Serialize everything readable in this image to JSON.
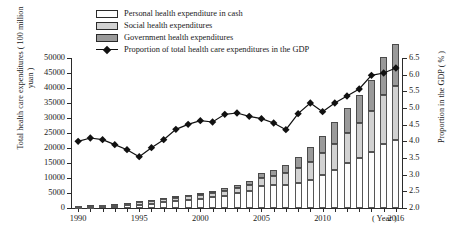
{
  "legend": {
    "items": [
      {
        "label": "Personal health expenditure in cash",
        "icon": "white-swatch",
        "color": "#fdfdfd"
      },
      {
        "label": "Social health expenditures",
        "icon": "light-gray-swatch",
        "color": "#d2d2d2"
      },
      {
        "label": "Government health expenditures",
        "icon": "dark-gray-swatch",
        "color": "#9a9a9a"
      },
      {
        "label": "Proportion of total health care expenditures in the GDP",
        "icon": "line-marker",
        "color": "#111111"
      }
    ]
  },
  "axes": {
    "left_title": "Total health care expenditures ( 100 million yuan )",
    "right_title": "Proportion in the GDP ( % )",
    "x_unit": "( Year )",
    "left_ticks": [
      "50000",
      "45000",
      "40000",
      "35000",
      "30000",
      "25000",
      "20000",
      "15000",
      "10000",
      "5000",
      "0"
    ],
    "right_ticks": [
      "6.5",
      "6.0",
      "5.5",
      "5.0",
      "4.5",
      "4.0",
      "3.5",
      "3.0",
      "2.5",
      "2.0"
    ],
    "x_ticks": [
      "1990",
      "1995",
      "2000",
      "2005",
      "2010",
      "2016"
    ]
  },
  "chart_data": {
    "type": "bar",
    "title": "",
    "xlabel": "Year",
    "ylabel": "Total health care expenditures ( 100 million yuan )",
    "y2label": "Proportion in the GDP ( % )",
    "ylim": [
      0,
      50000
    ],
    "y2lim": [
      2.0,
      6.5
    ],
    "grid": false,
    "legend_position": "top-left",
    "categories": [
      1990,
      1991,
      1992,
      1993,
      1994,
      1995,
      1996,
      1997,
      1998,
      1999,
      2000,
      2001,
      2002,
      2003,
      2004,
      2005,
      2006,
      2007,
      2008,
      2009,
      2010,
      2011,
      2012,
      2013,
      2014,
      2015,
      2016
    ],
    "series": [
      {
        "name": "Government health expenditures",
        "type": "bar-stack",
        "values": [
          187,
          205,
          229,
          273,
          343,
          387,
          461,
          523,
          590,
          640,
          710,
          801,
          909,
          1117,
          1294,
          1553,
          1779,
          2581,
          3594,
          4816,
          5732,
          7464,
          8432,
          9546,
          10579,
          12475,
          13910
        ]
      },
      {
        "name": "Social health expenditures",
        "type": "bar-stack",
        "values": [
          293,
          311,
          345,
          378,
          448,
          768,
          886,
          1003,
          1072,
          1066,
          1172,
          1211,
          1539,
          1789,
          2225,
          2586,
          3211,
          3894,
          5065,
          6154,
          7196,
          8416,
          10031,
          11393,
          13437,
          16507,
          17932
        ]
      },
      {
        "name": "Personal health expenditure in cash",
        "type": "bar-stack",
        "values": [
          267,
          377,
          522,
          727,
          971,
          1139,
          1430,
          1847,
          2255,
          2769,
          3146,
          3659,
          4139,
          4854,
          5543,
          7442,
          7604,
          7703,
          8254,
          9260,
          10994,
          12828,
          14874,
          16820,
          18754,
          21299,
          22755
        ]
      },
      {
        "name": "Proportion of total health care expenditures in the GDP",
        "type": "line",
        "values": [
          4.0,
          4.1,
          4.05,
          3.9,
          3.75,
          3.54,
          3.81,
          4.05,
          4.36,
          4.51,
          4.62,
          4.58,
          4.81,
          4.85,
          4.75,
          4.68,
          4.55,
          4.35,
          4.83,
          5.15,
          4.89,
          5.15,
          5.36,
          5.57,
          5.98,
          6.05,
          6.2
        ]
      }
    ]
  }
}
